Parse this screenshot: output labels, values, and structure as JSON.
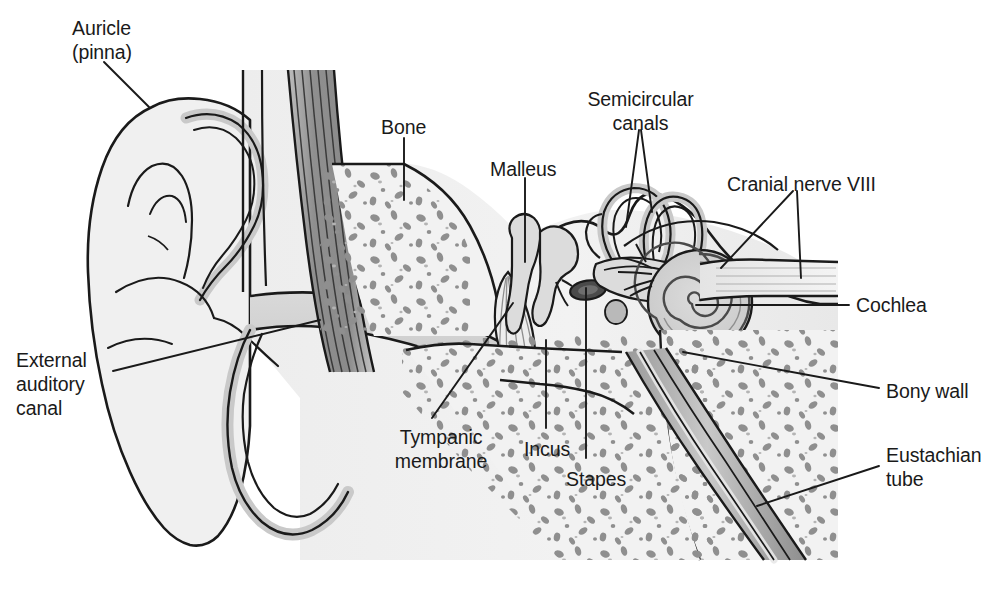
{
  "figure": {
    "background_color": "#ffffff",
    "line_color": "#1a1a1a",
    "tissue_fill": "#efefef",
    "mid_gray_fill": "#d9d9d9",
    "dark_gray_fill": "#a8a8a8",
    "darkest_gray_fill": "#8a8a8a",
    "text_color": "#1a1a1a"
  },
  "labels": [
    {
      "id": "auricle",
      "text": "Auricle\n(pinna)",
      "lines": [
        "Auricle",
        "(pinna)"
      ],
      "align": "left",
      "x": 72,
      "y": 16
    },
    {
      "id": "bone",
      "text": "Bone",
      "lines": [
        "Bone"
      ],
      "align": "left",
      "x": 381,
      "y": 115
    },
    {
      "id": "malleus",
      "text": "Malleus",
      "lines": [
        "Malleus"
      ],
      "align": "left",
      "x": 490,
      "y": 157
    },
    {
      "id": "semicircular-canals",
      "text": "Semicircular\ncanals",
      "lines": [
        "Semicircular",
        "canals"
      ],
      "align": "center",
      "x": 583,
      "y": 87
    },
    {
      "id": "cranial-nerve-viii",
      "text": "Cranial nerve VIII",
      "lines": [
        "Cranial nerve VIII"
      ],
      "align": "left",
      "x": 727,
      "y": 172
    },
    {
      "id": "cochlea",
      "text": "Cochlea",
      "lines": [
        "Cochlea"
      ],
      "align": "left",
      "x": 856,
      "y": 293
    },
    {
      "id": "bony-wall",
      "text": "Bony wall",
      "lines": [
        "Bony wall"
      ],
      "align": "left",
      "x": 886,
      "y": 379
    },
    {
      "id": "eustachian-tube",
      "text": "Eustachian\ntube",
      "lines": [
        "Eustachian",
        "tube"
      ],
      "align": "left",
      "x": 886,
      "y": 443
    },
    {
      "id": "external-auditory-canal",
      "text": "External\nauditory\ncanal",
      "lines": [
        "External",
        "auditory",
        "canal"
      ],
      "align": "left",
      "x": 16,
      "y": 348
    },
    {
      "id": "tympanic-membrane",
      "text": "Tympanic\nmembrane",
      "lines": [
        "Tympanic",
        "membrane"
      ],
      "align": "center",
      "x": 378,
      "y": 425
    },
    {
      "id": "incus",
      "text": "Incus",
      "lines": [
        "Incus"
      ],
      "align": "left",
      "x": 524,
      "y": 437
    },
    {
      "id": "stapes",
      "text": "Stapes",
      "lines": [
        "Stapes"
      ],
      "align": "left",
      "x": 566,
      "y": 467
    }
  ],
  "leader_lines": [
    {
      "id": "leader-auricle",
      "points": "104,62 149,107"
    },
    {
      "id": "leader-bone",
      "points": "404,138 404,200"
    },
    {
      "id": "leader-malleus",
      "points": "525,178 525,262"
    },
    {
      "id": "leader-semicircular-a",
      "points": "639,130 626,227"
    },
    {
      "id": "leader-semicircular-b",
      "points": "641,130 652,212"
    },
    {
      "id": "leader-cranial-a",
      "points": "793,191 721,268"
    },
    {
      "id": "leader-cranial-b",
      "points": "797,191 801,278"
    },
    {
      "id": "leader-cochlea",
      "points": "849,305 696,305"
    },
    {
      "id": "leader-bony-wall",
      "points": "879,388 683,352"
    },
    {
      "id": "leader-eustachian",
      "points": "879,466 757,506"
    },
    {
      "id": "leader-external-canal",
      "points": "113,371 320,320"
    },
    {
      "id": "leader-tympanic-membrane",
      "points": "432,418 513,303"
    },
    {
      "id": "leader-incus",
      "points": "546,428 546,340"
    },
    {
      "id": "leader-stapes",
      "points": "586,458 586,288"
    }
  ]
}
